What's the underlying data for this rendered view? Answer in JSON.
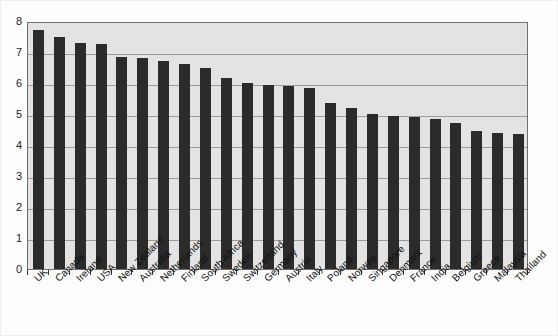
{
  "chart_data": {
    "type": "bar",
    "title": "",
    "xlabel": "",
    "ylabel": "",
    "ylim": [
      0,
      8
    ],
    "ytick_step": 1,
    "grid": true,
    "legend": false,
    "bar_color": "#2b2b2b",
    "plot_background": "#e3e3e3",
    "categories": [
      "UK",
      "Canada",
      "Ireland",
      "USA",
      "New Zealand",
      "Australia",
      "Netherlands",
      "Finland",
      "South Africa",
      "Sweden",
      "Switzerland",
      "Germany",
      "Austria",
      "Italy",
      "Poland",
      "Norway",
      "Singapore",
      "Denmark",
      "France",
      "India",
      "Belgium",
      "Greece",
      "Malaysia",
      "Thailand"
    ],
    "values": [
      7.7,
      7.5,
      7.3,
      7.25,
      6.85,
      6.8,
      6.7,
      6.6,
      6.5,
      6.15,
      6.0,
      5.95,
      5.9,
      5.85,
      5.35,
      5.2,
      5.0,
      4.95,
      4.9,
      4.85,
      4.7,
      4.45,
      4.4,
      4.35
    ],
    "ytick_labels": [
      "8",
      "7",
      "6",
      "5",
      "4",
      "3",
      "2",
      "1",
      "0"
    ],
    "ytick_values": [
      8,
      7,
      6,
      5,
      4,
      3,
      2,
      1,
      0
    ]
  }
}
